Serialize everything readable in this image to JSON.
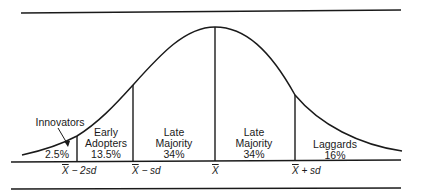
{
  "diagram": {
    "type": "normal-distribution-adoption-curve",
    "segments": [
      {
        "name": "Innovators",
        "line1": "",
        "line2": "Innovators",
        "percent": "2.5%"
      },
      {
        "name": "Early Adopters",
        "line1": "Early",
        "line2": "Adopters",
        "percent": "13.5%"
      },
      {
        "name": "Late Majority (left)",
        "line1": "Late",
        "line2": "Majority",
        "percent": "34%"
      },
      {
        "name": "Late Majority (right)",
        "line1": "Late",
        "line2": "Majority",
        "percent": "34%"
      },
      {
        "name": "Laggards",
        "line1": "",
        "line2": "Laggards",
        "percent": "16%"
      }
    ],
    "axis_labels": [
      {
        "symbol": "X",
        "suffix": " − 2sd"
      },
      {
        "symbol": "X",
        "suffix": " − sd"
      },
      {
        "symbol": "X",
        "suffix": ""
      },
      {
        "symbol": "X",
        "suffix": " + sd"
      }
    ],
    "colors": {
      "line": "#1a1a1a",
      "background": "#ffffff"
    }
  }
}
